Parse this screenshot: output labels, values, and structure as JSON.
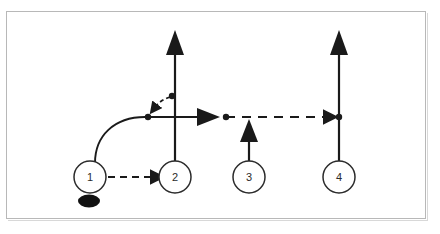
{
  "diagram": {
    "type": "sports-play-diagram",
    "title": "",
    "frame": {
      "stroke": "#b8b8b8",
      "fill": "#ffffff"
    },
    "ink_color": "#1a1a1a",
    "players": [
      {
        "id": "p1",
        "label": "1",
        "cx": 90,
        "cy": 177,
        "r": 16
      },
      {
        "id": "p2",
        "label": "2",
        "cx": 175,
        "cy": 177,
        "r": 16
      },
      {
        "id": "p3",
        "label": "3",
        "cx": 249,
        "cy": 177,
        "r": 16
      },
      {
        "id": "p4",
        "label": "4",
        "cx": 339,
        "cy": 177,
        "r": 16
      }
    ],
    "puck": {
      "cx": 89,
      "cy": 201,
      "rx": 11,
      "ry": 6,
      "fill": "#111111"
    },
    "markers": [
      {
        "id": "m1",
        "cx": 148,
        "cy": 117,
        "r": 3
      },
      {
        "id": "m2",
        "cx": 172,
        "cy": 96,
        "r": 3
      },
      {
        "id": "m3",
        "cx": 220,
        "cy": 117,
        "r": 3
      },
      {
        "id": "m4",
        "cx": 339,
        "cy": 117,
        "r": 3
      }
    ],
    "paths": [
      {
        "id": "pass-1-to-2",
        "style": "dashed",
        "arrow": "solid-head",
        "desc": "pass from player 1 to player 2"
      },
      {
        "id": "skate-1-curve",
        "style": "solid",
        "arrow": "none",
        "desc": "player 1 curls up to the high slot"
      },
      {
        "id": "skate-2-up",
        "style": "solid",
        "arrow": "solid-head",
        "desc": "player 2 drives straight up"
      },
      {
        "id": "drop-back-curve",
        "style": "dashed",
        "arrow": "solid-head",
        "desc": "short curved drop pass back down-left"
      },
      {
        "id": "carry-right",
        "style": "solid",
        "arrow": "solid-head",
        "desc": "puck carried right along the blue line"
      },
      {
        "id": "pass-right",
        "style": "dashed",
        "arrow": "solid-head",
        "desc": "pass across to player 4 lane"
      },
      {
        "id": "skate-3-up",
        "style": "solid",
        "arrow": "solid-head",
        "desc": "player 3 drives up into the line"
      },
      {
        "id": "skate-4-up",
        "style": "solid",
        "arrow": "solid-head",
        "desc": "player 4 drives straight up"
      }
    ]
  }
}
